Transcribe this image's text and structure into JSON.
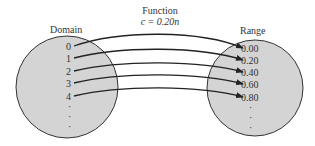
{
  "diagram": {
    "function_label": "Function",
    "function_formula": "c = 0.20n",
    "domain_label": "Domain",
    "range_label": "Range",
    "domain_values": [
      "0",
      "1",
      "2",
      "3",
      "4"
    ],
    "range_values": [
      "0.00",
      "0.20",
      "0.40",
      "0.60",
      "0.80"
    ],
    "ellipsis": "·",
    "colors": {
      "circle_fill": "#d4d4d4",
      "circle_stroke": "#333333",
      "arrow": "#222222"
    }
  }
}
